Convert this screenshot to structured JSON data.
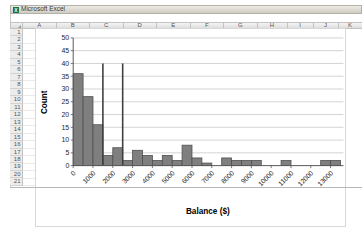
{
  "window": {
    "title": "Microsoft Excel"
  },
  "spreadsheet": {
    "column_headers": [
      "A",
      "B",
      "C",
      "D",
      "E",
      "F",
      "G",
      "H",
      "I",
      "J",
      "K"
    ],
    "row_headers": [
      "1",
      "2",
      "3",
      "4",
      "5",
      "6",
      "7",
      "8",
      "9",
      "10",
      "11",
      "12",
      "13",
      "14",
      "15",
      "16",
      "17",
      "18",
      "19",
      "20",
      "21"
    ]
  },
  "chart_data": {
    "type": "bar",
    "subtype": "histogram",
    "title": "",
    "xlabel": "Balance ($)",
    "ylabel": "Count",
    "bin_width": 500,
    "x_start": 0,
    "counts": [
      36,
      27,
      16,
      4,
      7,
      2,
      6,
      4,
      2,
      4,
      2,
      8,
      3,
      1,
      0,
      3,
      2,
      2,
      2,
      0,
      0,
      2,
      0,
      0,
      0,
      2,
      2
    ],
    "x_tick_interval": 1000,
    "x_tick_labels": [
      "0",
      "1000",
      "2000",
      "3000",
      "4000",
      "5000",
      "6000",
      "7000",
      "8000",
      "9000",
      "10000",
      "11000",
      "12000",
      "13000"
    ],
    "y_ticks": [
      0,
      5,
      10,
      15,
      20,
      25,
      30,
      35,
      40,
      45,
      50
    ],
    "ylim": [
      0,
      50
    ],
    "xlim": [
      0,
      13750
    ],
    "grid": "horizontal",
    "legend": "none",
    "reference_lines": [
      {
        "x": 1500,
        "height": 40
      },
      {
        "x": 2500,
        "height": 40
      }
    ],
    "bar_fill": "#7f7f7f",
    "bar_stroke": "#4f4f4f",
    "gridline_color": "#c9c9c9",
    "axis_color": "#595959",
    "reference_line_color": "#3f3f3f",
    "tick_label_color": "#262626",
    "axis_title_color": "#000000"
  }
}
